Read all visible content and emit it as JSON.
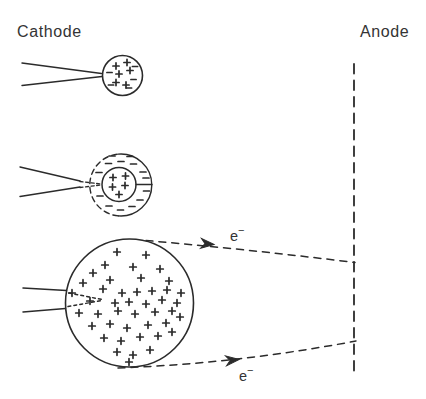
{
  "labels": {
    "cathode": "Cathode",
    "anode": "Anode",
    "electron_top": {
      "base": "e",
      "sup": "−"
    },
    "electron_bottom": {
      "base": "e",
      "sup": "−"
    }
  },
  "colors": {
    "ink": "#2b2b2b",
    "background": "#ffffff"
  },
  "canvas": {
    "width": 426,
    "height": 399
  },
  "shapes": [
    {
      "type": "line",
      "name": "anode-electrode-line",
      "x1": 354,
      "y1": 64,
      "x2": 354,
      "y2": 371,
      "w": 1.8,
      "dash": "9.5 7"
    },
    {
      "type": "line",
      "name": "stage1-cathode-top-edge",
      "x1": 22,
      "y1": 63,
      "x2": 101.5,
      "y2": 73.5,
      "w": 1.4
    },
    {
      "type": "line",
      "name": "stage1-cathode-bottom-edge",
      "x1": 22,
      "y1": 85.5,
      "x2": 102,
      "y2": 76.5,
      "w": 1.4
    },
    {
      "type": "circle",
      "name": "stage1-plasma-ball",
      "cx": 122.5,
      "cy": 75.5,
      "r": 20,
      "w": 1.6
    },
    {
      "type": "plus-group",
      "name": "stage1-positive-charges",
      "s": 3.1,
      "points": [
        [
          116,
          66
        ],
        [
          127,
          62.5
        ],
        [
          119,
          74
        ],
        [
          130,
          70.5
        ],
        [
          116,
          82.5
        ],
        [
          126,
          85
        ]
      ]
    },
    {
      "type": "minus-group",
      "name": "stage1-negative-charges",
      "s": 2.6,
      "points": [
        [
          109.5,
          72.5
        ],
        [
          135,
          66.5
        ],
        [
          133.5,
          79.5
        ],
        [
          111,
          85
        ],
        [
          129,
          88
        ]
      ]
    },
    {
      "type": "line",
      "name": "stage2-cathode-top-edge",
      "x1": 20,
      "y1": 167,
      "x2": 80,
      "y2": 181,
      "w": 1.4
    },
    {
      "type": "line",
      "name": "stage2-cathode-bottom-edge",
      "x1": 20,
      "y1": 196.5,
      "x2": 80,
      "y2": 187,
      "w": 1.4
    },
    {
      "type": "line",
      "name": "stage2-tip-dash-top",
      "x1": 80,
      "y1": 181.5,
      "x2": 101,
      "y2": 184,
      "w": 1.4,
      "dash": "3 2.6"
    },
    {
      "type": "line",
      "name": "stage2-tip-dash-bottom",
      "x1": 80,
      "y1": 187.5,
      "x2": 101,
      "y2": 185,
      "w": 1.4,
      "dash": "3 2.6"
    },
    {
      "type": "path",
      "name": "stage2-sheath-solid-arc",
      "d": "M118.3 154.1 A31 31 0 1 1 118.3 215.9",
      "w": 1.4
    },
    {
      "type": "path",
      "name": "stage2-sheath-dashed-arc",
      "d": "M118.3 215.9 A31 31 0 0 1 118.3 154.1",
      "w": 1.4,
      "dash": "5.5 4"
    },
    {
      "type": "circle",
      "name": "stage2-plasma-core",
      "cx": 119,
      "cy": 184.5,
      "r": 17,
      "w": 1.5
    },
    {
      "type": "line",
      "name": "stage2-spoke-right",
      "x1": 136,
      "y1": 184.5,
      "x2": 152,
      "y2": 184.5,
      "w": 1.3
    },
    {
      "type": "plus-group",
      "name": "stage2-positive-charges",
      "s": 3.1,
      "points": [
        [
          113,
          177.5
        ],
        [
          125.5,
          176
        ],
        [
          112.5,
          187
        ],
        [
          125,
          185.5
        ],
        [
          119,
          194.5
        ]
      ]
    },
    {
      "type": "minus-group",
      "name": "stage2-negative-sheath-charges",
      "s": 3,
      "points": [
        [
          112,
          156
        ],
        [
          130,
          156.5
        ],
        [
          121,
          161.5
        ],
        [
          108.5,
          163.5
        ],
        [
          133.5,
          164
        ],
        [
          99,
          172.5
        ],
        [
          143,
          172
        ],
        [
          146,
          178
        ],
        [
          146.5,
          191
        ],
        [
          100,
          196
        ],
        [
          140,
          200
        ],
        [
          109,
          206
        ],
        [
          132,
          206.5
        ],
        [
          120.5,
          210
        ]
      ]
    },
    {
      "type": "line",
      "name": "stage3-cathode-top-edge",
      "x1": 23,
      "y1": 288,
      "x2": 66.5,
      "y2": 290.5,
      "w": 1.5
    },
    {
      "type": "line",
      "name": "stage3-cathode-bottom-edge",
      "x1": 23,
      "y1": 312,
      "x2": 65.5,
      "y2": 308.5,
      "w": 1.5
    },
    {
      "type": "circle",
      "name": "stage3-plasma-sphere",
      "cx": 129.5,
      "cy": 303,
      "r": 64,
      "w": 1.6
    },
    {
      "type": "line",
      "name": "stage3-tip-dot-top",
      "x1": 69,
      "y1": 293,
      "x2": 102,
      "y2": 299.5,
      "w": 1.5,
      "dash": "2.8 3.2"
    },
    {
      "type": "line",
      "name": "stage3-tip-dot-bottom",
      "x1": 68,
      "y1": 306.5,
      "x2": 102,
      "y2": 300.5,
      "w": 1.5,
      "dash": "2.8 3.2"
    },
    {
      "type": "plus-group",
      "name": "stage3-positive-charges",
      "s": 3.3,
      "points": [
        [
          117,
          252
        ],
        [
          146,
          255
        ],
        [
          105,
          265
        ],
        [
          133,
          267
        ],
        [
          160,
          269
        ],
        [
          93,
          273
        ],
        [
          83,
          283
        ],
        [
          110,
          280
        ],
        [
          141,
          278
        ],
        [
          169,
          281
        ],
        [
          72,
          293
        ],
        [
          103,
          289
        ],
        [
          122,
          293
        ],
        [
          137,
          292
        ],
        [
          152,
          291
        ],
        [
          167,
          290
        ],
        [
          181,
          293
        ],
        [
          90,
          301
        ],
        [
          115,
          303
        ],
        [
          129,
          302
        ],
        [
          146,
          304
        ],
        [
          162,
          300
        ],
        [
          177,
          303
        ],
        [
          79,
          313
        ],
        [
          98,
          314
        ],
        [
          118,
          311
        ],
        [
          135,
          314
        ],
        [
          155,
          312
        ],
        [
          172,
          311
        ],
        [
          92,
          326
        ],
        [
          110,
          324
        ],
        [
          127,
          328
        ],
        [
          148,
          325
        ],
        [
          166,
          323
        ],
        [
          180,
          317
        ],
        [
          104,
          338
        ],
        [
          121,
          341
        ],
        [
          140,
          337
        ],
        [
          158,
          336
        ],
        [
          172,
          332
        ],
        [
          117,
          352
        ],
        [
          133,
          355
        ],
        [
          150,
          350
        ],
        [
          129,
          362
        ]
      ]
    },
    {
      "type": "path",
      "name": "electron-beam-top",
      "d": "M146 240.5 Q249 249.5 355 262.5",
      "w": 1.5,
      "dash": "7 6"
    },
    {
      "type": "path",
      "name": "electron-beam-bottom",
      "d": "M118 368 Q237 363.5 356 341",
      "w": 1.5,
      "dash": "7 6"
    },
    {
      "type": "arrow",
      "name": "electron-arrow-top",
      "x": 214,
      "y": 244.5,
      "angle": 5
    },
    {
      "type": "arrow",
      "name": "electron-arrow-bottom",
      "x": 239,
      "y": 359.5,
      "angle": -6
    }
  ]
}
